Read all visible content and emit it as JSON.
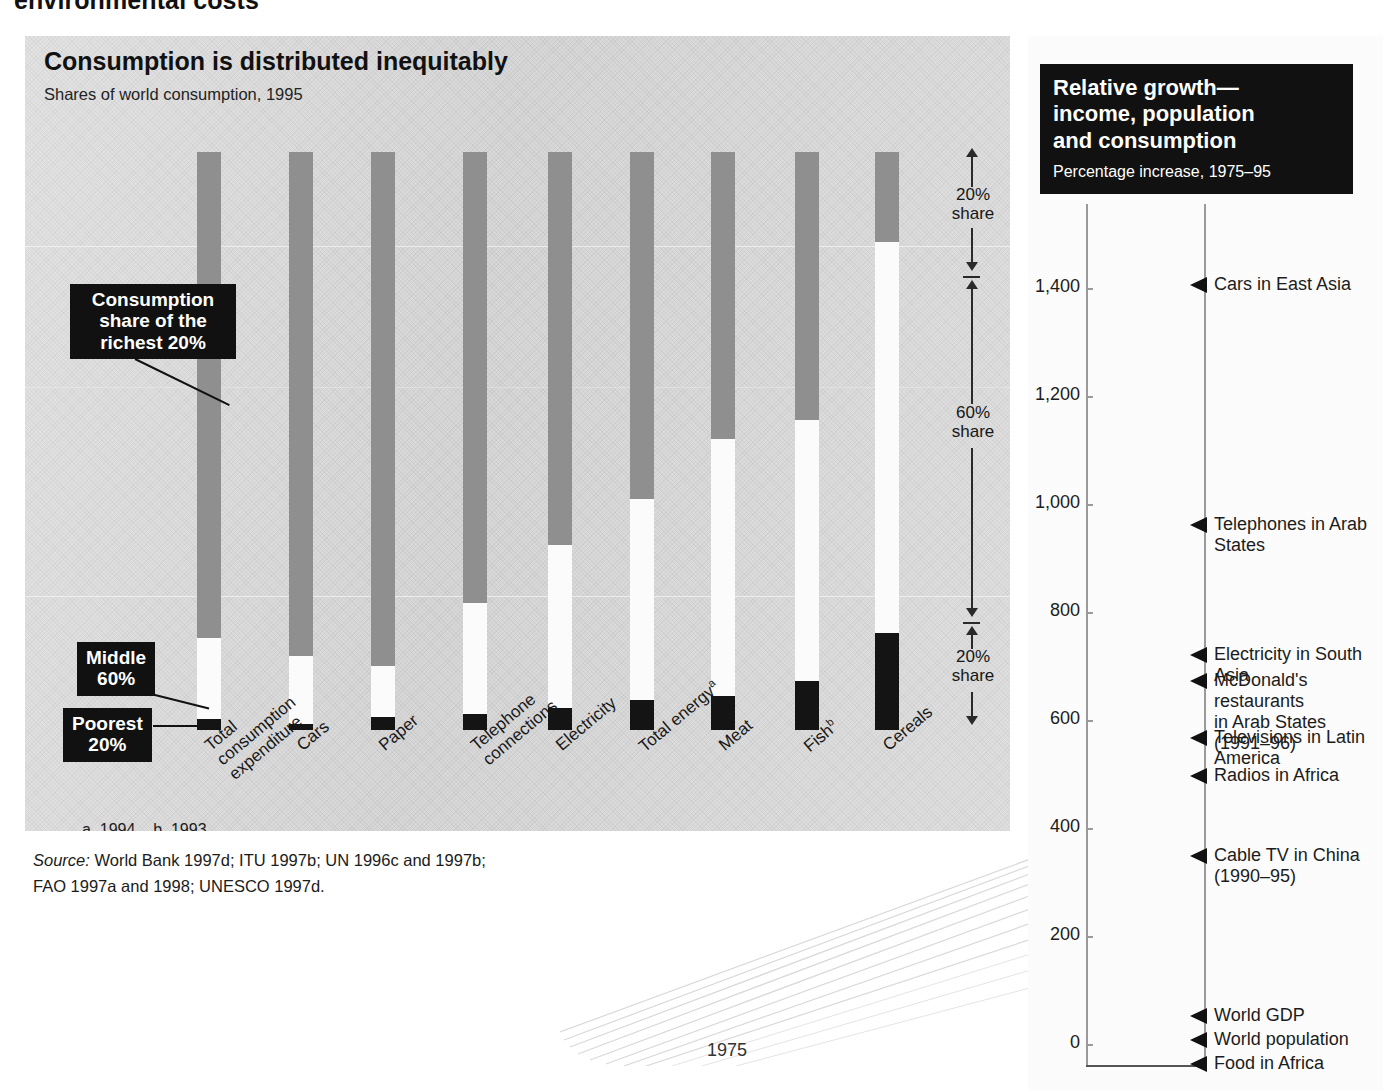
{
  "page": {
    "cropped_heading": "environmental costs"
  },
  "left_chart": {
    "title": "Consumption is distributed inequitably",
    "subtitle": "Shares of world consumption, 1995",
    "callouts": {
      "richest": "Consumption\nshare of the\nrichest 20%",
      "middle": "Middle\n60%",
      "poorest": "Poorest\n20%"
    },
    "share_notes": {
      "top": "20%\nshare",
      "middle": "60%\nshare",
      "bottom": "20%\nshare"
    },
    "footnote": "a. 1994.   b. 1993.",
    "source_line1": "World Bank 1997d; ITU 1997b; UN 1996c and 1997b;",
    "source_line2": "FAO 1997a and 1998; UNESCO 1997d.",
    "source_label": "Source:"
  },
  "right_chart": {
    "title": "Relative growth—\nincome, population\nand consumption",
    "subtitle": "Percentage increase, 1975–95",
    "axis_ticks": [
      "1,400",
      "1,200",
      "1,000",
      "800",
      "600",
      "400",
      "200",
      "0"
    ],
    "year_start": "1975",
    "year_end": "1995"
  },
  "chart_data": [
    {
      "type": "bar",
      "title": "Consumption is distributed inequitably",
      "subtitle": "Shares of world consumption, 1995",
      "xlabel": "",
      "ylabel": "Share of world consumption (%)",
      "ylim": [
        0,
        100
      ],
      "grid": false,
      "legend": [
        "Richest 20%",
        "Middle 60%",
        "Poorest 20%"
      ],
      "legend_position": "annotated-callouts",
      "categories": [
        "Total\nconsumption\nexpenditure",
        "Cars",
        "Paper",
        "Telephone\nconnections",
        "Electricity",
        "Total energy",
        "Meat",
        "Fish",
        "Cereals"
      ],
      "category_footnotes": [
        "",
        "",
        "",
        "",
        "",
        "a",
        "",
        "b",
        ""
      ],
      "series": [
        {
          "name": "Richest 20%",
          "color": "#8f8f8f",
          "values": [
            86,
            87,
            84,
            74,
            58,
            58,
            45,
            45,
            14
          ]
        },
        {
          "name": "Middle 60%",
          "color": "#fbfbfb",
          "values": [
            12,
            12,
            15,
            24,
            39,
            37,
            50,
            47,
            57
          ]
        },
        {
          "name": "Poorest 20%",
          "color": "#141414",
          "values": [
            1.3,
            1,
            1.1,
            1.5,
            2.5,
            4,
            5,
            7,
            29
          ]
        }
      ],
      "reference_bands": [
        {
          "label": "20% share",
          "from": 80,
          "to": 100
        },
        {
          "label": "60% share",
          "from": 20,
          "to": 80
        },
        {
          "label": "20% share",
          "from": 0,
          "to": 20
        }
      ]
    },
    {
      "type": "scatter",
      "title": "Relative growth—income, population and consumption",
      "subtitle": "Percentage increase, 1975–95",
      "xlabel": "",
      "ylabel": "Percentage increase",
      "ylim": [
        0,
        1500
      ],
      "yticks": [
        0,
        200,
        400,
        600,
        800,
        1000,
        1200,
        1400
      ],
      "ytick_labels": [
        "0",
        "200",
        "400",
        "600",
        "800",
        "1,000",
        "1,200",
        "1,400"
      ],
      "grid": false,
      "x": [
        "1975",
        "1995"
      ],
      "points": [
        {
          "label": "Cars in East Asia",
          "value": 1400
        },
        {
          "label": "Telephones in Arab States",
          "value": 965
        },
        {
          "label": "Electricity in South Asia",
          "value": 715
        },
        {
          "label": "McDonald's restaurants\nin Arab States (1991–96)",
          "value": 655
        },
        {
          "label": "Televisions in Latin America",
          "value": 540
        },
        {
          "label": "Radios in Africa",
          "value": 475
        },
        {
          "label": "Cable TV in China\n(1990–95)",
          "value": 320
        },
        {
          "label": "World GDP",
          "value": 50
        },
        {
          "label": "World population",
          "value": 28
        },
        {
          "label": "Food in Africa",
          "value": 5
        }
      ]
    }
  ],
  "bars_geometry": [
    {
      "name": "Total consumption expenditure",
      "left": 172,
      "rich_top": 116,
      "mid_top": 602,
      "poor_top": 683,
      "bottom": 694
    },
    {
      "name": "Cars",
      "left": 264,
      "rich_top": 116,
      "mid_top": 620,
      "poor_top": 688,
      "bottom": 694
    },
    {
      "name": "Paper",
      "left": 346,
      "rich_top": 116,
      "mid_top": 630,
      "poor_top": 681,
      "bottom": 694
    },
    {
      "name": "Telephone connections",
      "left": 438,
      "rich_top": 116,
      "mid_top": 567,
      "poor_top": 678,
      "bottom": 694
    },
    {
      "name": "Electricity",
      "left": 523,
      "rich_top": 116,
      "mid_top": 509,
      "poor_top": 672,
      "bottom": 694
    },
    {
      "name": "Total energy",
      "left": 605,
      "rich_top": 116,
      "mid_top": 463,
      "poor_top": 664,
      "bottom": 694
    },
    {
      "name": "Meat",
      "left": 686,
      "rich_top": 116,
      "mid_top": 403,
      "poor_top": 660,
      "bottom": 694
    },
    {
      "name": "Fish",
      "left": 770,
      "rich_top": 116,
      "mid_top": 384,
      "poor_top": 645,
      "bottom": 694
    },
    {
      "name": "Cereals",
      "left": 850,
      "rich_top": 116,
      "mid_top": 206,
      "poor_top": 597,
      "bottom": 694
    }
  ],
  "markers_geometry": [
    {
      "label": "Cars in East Asia",
      "top": 249
    },
    {
      "label": "Telephones in Arab States",
      "top": 489
    },
    {
      "label": "Electricity in South Asia",
      "top": 619
    },
    {
      "label": "McDonald's restaurants\nin Arab States (1991–96)",
      "top": 645
    },
    {
      "label": "Televisions in Latin America",
      "top": 702
    },
    {
      "label": "Radios in Africa",
      "top": 740
    },
    {
      "label": "Cable TV in China\n(1990–95)",
      "top": 820
    },
    {
      "label": "World GDP",
      "top": 980
    },
    {
      "label": "World population",
      "top": 1004
    },
    {
      "label": "Food in Africa",
      "top": 1028
    }
  ],
  "tick_geometry": [
    {
      "label": "1,400",
      "top": 252
    },
    {
      "label": "1,200",
      "top": 360
    },
    {
      "label": "1,000",
      "top": 468
    },
    {
      "label": "800",
      "top": 576
    },
    {
      "label": "600",
      "top": 684
    },
    {
      "label": "400",
      "top": 792
    },
    {
      "label": "200",
      "top": 900
    },
    {
      "label": "0",
      "top": 1008
    }
  ]
}
